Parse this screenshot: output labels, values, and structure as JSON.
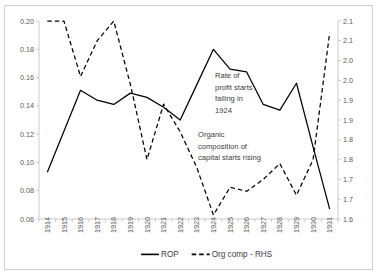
{
  "chart_data": {
    "type": "line",
    "title": "",
    "xlabel": "",
    "ylabel": "",
    "categories": [
      "1914",
      "1915",
      "1916",
      "1917",
      "1918",
      "1919",
      "1920",
      "1921",
      "1922",
      "1923",
      "1924",
      "1925",
      "1926",
      "1927",
      "1928",
      "1929",
      "1930",
      "1931"
    ],
    "ylim": [
      0.06,
      0.2
    ],
    "y2lim": [
      1.65,
      2.15
    ],
    "yticks": [
      "0.06",
      "0.08",
      "0.10",
      "0.12",
      "0.14",
      "0.16",
      "0.18",
      "0.20"
    ],
    "ytick_values": [
      0.06,
      0.08,
      0.1,
      0.12,
      0.14,
      0.16,
      0.18,
      0.2
    ],
    "y2ticks": [
      "1.6",
      "1.7",
      "1.7",
      "1.8",
      "1.8",
      "1.9",
      "1.9",
      "2.0",
      "2.0",
      "2.1",
      "2.1"
    ],
    "y2tick_values": [
      1.65,
      1.7,
      1.75,
      1.8,
      1.85,
      1.9,
      1.95,
      2.0,
      2.05,
      2.1,
      2.15
    ],
    "grid": false,
    "legend_position": "bottom",
    "series": [
      {
        "name": "ROP",
        "axis": "left",
        "style": "solid",
        "color": "#000000",
        "values": [
          0.093,
          0.122,
          0.151,
          0.144,
          0.141,
          0.149,
          0.146,
          0.139,
          0.13,
          0.155,
          0.18,
          0.166,
          0.164,
          0.141,
          0.137,
          0.156,
          0.111,
          0.067
        ]
      },
      {
        "name": "Org comp - RHS",
        "axis": "right",
        "style": "dashed",
        "color": "#000000",
        "values": [
          2.15,
          2.15,
          2.01,
          2.1,
          2.15,
          1.99,
          1.8,
          1.94,
          1.87,
          1.78,
          1.66,
          1.73,
          1.72,
          1.75,
          1.79,
          1.71,
          1.8,
          2.12
        ]
      }
    ],
    "annotations": [
      {
        "id": "rop-annotation",
        "lines": [
          "Rate of",
          "profit starts",
          "falling in",
          "1924"
        ],
        "x": 210,
        "y": 72
      },
      {
        "id": "org-annotation",
        "lines": [
          "Organic",
          "composition of",
          "capital starts rising"
        ],
        "x": 193,
        "y": 131
      }
    ]
  },
  "legend": {
    "items": [
      {
        "label": "ROP",
        "style": "solid"
      },
      {
        "label": "Org comp - RHS",
        "style": "dashed"
      }
    ]
  }
}
